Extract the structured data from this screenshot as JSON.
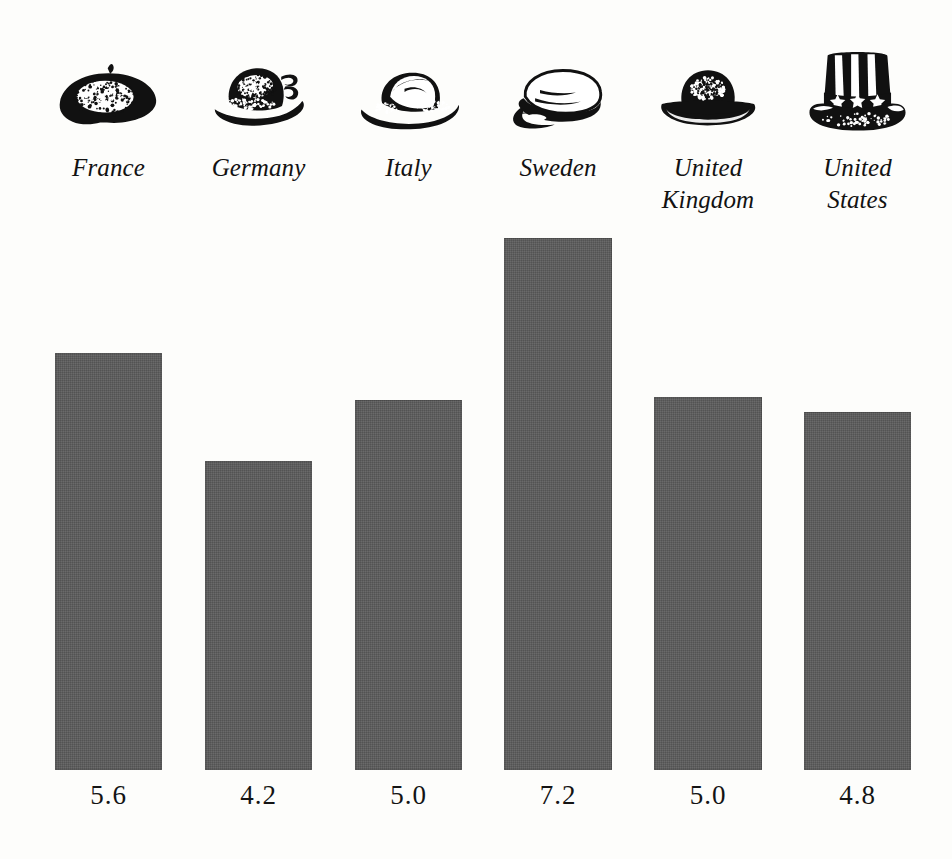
{
  "page": {
    "background_color": "#fdfdfb",
    "bar_color": "#5b5b5b",
    "text_color": "#141414"
  },
  "chart_data": {
    "type": "bar",
    "title": "",
    "subtitle": "",
    "xlabel": "",
    "ylabel": "",
    "grid": false,
    "legend": false,
    "categories": [
      "France",
      "Germany",
      "Italy",
      "Sweden",
      "United Kingdom",
      "United States"
    ],
    "values": [
      5.6,
      4.2,
      5.0,
      7.2,
      5.0,
      4.8
    ],
    "value_labels": [
      "5.6",
      "4.2",
      "5.0",
      "7.2",
      "5.0",
      "4.8"
    ],
    "category_icons": [
      "beret-hat-icon",
      "alpine-hat-icon",
      "fedora-hat-icon",
      "swedish-cap-icon",
      "bowler-hat-icon",
      "top-hat-icon"
    ]
  },
  "layout": {
    "baseline_y": 770,
    "value_label_y": 780,
    "bars": [
      {
        "category": "France",
        "value": 5.6,
        "label": "5.6",
        "left": 55,
        "width": 107,
        "top": 353,
        "height": 417,
        "icon": "beret-hat-icon",
        "label_lines": [
          "France"
        ]
      },
      {
        "category": "Germany",
        "value": 4.2,
        "label": "4.2",
        "left": 205,
        "width": 107,
        "top": 461,
        "height": 309,
        "icon": "alpine-hat-icon",
        "label_lines": [
          "Germany"
        ]
      },
      {
        "category": "Italy",
        "value": 5.0,
        "label": "5.0",
        "left": 355,
        "width": 107,
        "top": 400,
        "height": 370,
        "icon": "fedora-hat-icon",
        "label_lines": [
          "Italy"
        ]
      },
      {
        "category": "Sweden",
        "value": 7.2,
        "label": "7.2",
        "left": 504,
        "width": 108,
        "top": 238,
        "height": 532,
        "icon": "swedish-cap-icon",
        "label_lines": [
          "Sweden"
        ]
      },
      {
        "category": "United Kingdom",
        "value": 5.0,
        "label": "5.0",
        "left": 654,
        "width": 108,
        "top": 397,
        "height": 373,
        "icon": "bowler-hat-icon",
        "label_lines": [
          "United",
          "Kingdom"
        ]
      },
      {
        "category": "United States",
        "value": 4.8,
        "label": "4.8",
        "left": 804,
        "width": 107,
        "top": 412,
        "height": 358,
        "icon": "top-hat-icon",
        "label_lines": [
          "United",
          "States"
        ]
      }
    ]
  }
}
